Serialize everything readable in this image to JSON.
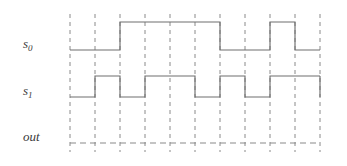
{
  "figure": {
    "type": "digital-timing-diagram",
    "background_color": "#ffffff",
    "wave_color": "#6e6e6e",
    "grid_color": "#8a8a8a"
  },
  "signals": [
    {
      "name": "s0",
      "label_base": "s",
      "label_sub": "0",
      "style": "solid",
      "row_index": 0,
      "high_y": 22,
      "low_y": 50,
      "initial_level": "low",
      "levels": [
        0,
        0,
        1,
        1,
        1,
        1,
        0,
        0,
        1,
        0,
        1
      ],
      "description": "period-4 square wave, starts low"
    },
    {
      "name": "s1",
      "label_base": "s",
      "label_sub": "1",
      "style": "solid",
      "row_index": 1,
      "high_y": 76,
      "low_y": 97,
      "initial_level": "low",
      "levels": [
        0,
        1,
        0,
        1,
        1,
        0,
        1,
        0,
        1,
        1,
        0
      ],
      "description": "period-2 square wave, starts low"
    },
    {
      "name": "out",
      "label_base": "out",
      "label_sub": "",
      "style": "dashed",
      "row_index": 2,
      "high_y": 143,
      "low_y": 143,
      "initial_level": "undefined",
      "levels": [],
      "description": "undefined / blank dashed baseline"
    }
  ],
  "grid": {
    "x_start": 70,
    "x_end": 320,
    "spacing": 25,
    "count": 11,
    "y_top": 14,
    "y_bottom": 152,
    "positions": [
      70,
      95,
      120,
      145,
      170,
      195,
      220,
      245,
      270,
      295,
      320
    ],
    "dash_pattern": "4 4"
  },
  "labels": {
    "s0": {
      "x": 23,
      "y": 48,
      "text": "s",
      "sub": "0"
    },
    "s1": {
      "x": 23,
      "y": 95,
      "text": "s",
      "sub": "1"
    },
    "out": {
      "x": 23,
      "y": 141,
      "text": "out",
      "sub": ""
    }
  }
}
